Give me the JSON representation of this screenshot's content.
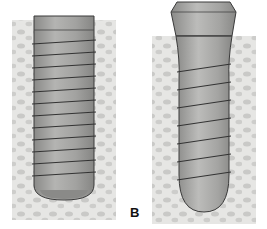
{
  "figure": {
    "panels": [
      {
        "id": "A",
        "name": "parallel-walled implant",
        "label": ""
      },
      {
        "id": "B",
        "name": "tapered implant with collar",
        "label": "B"
      }
    ],
    "colors": {
      "background": "#ffffff",
      "bone": "#e4e4e2",
      "bone_pores": "#c8c8c6",
      "implant_body": "#9e9e9c",
      "implant_dark": "#7a7a78",
      "implant_light": "#c2c2c0",
      "outline": "#3a3a3a"
    }
  }
}
